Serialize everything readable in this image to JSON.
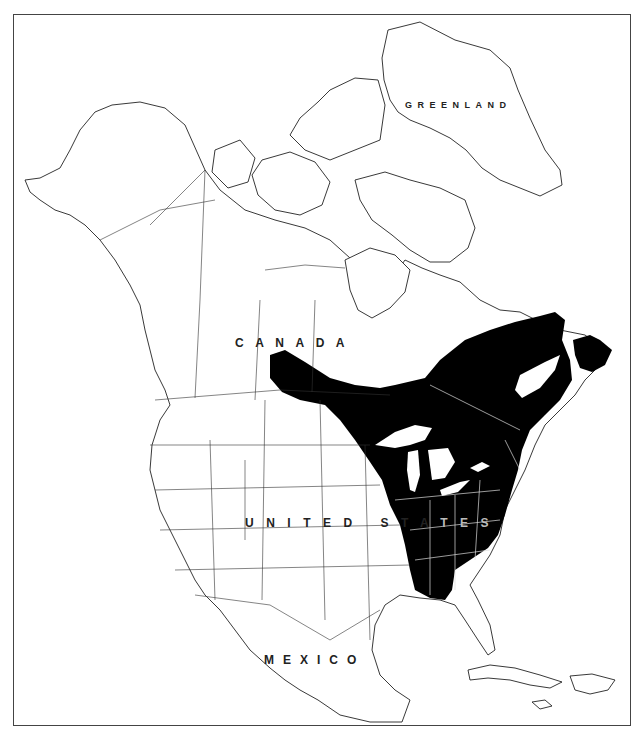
{
  "map": {
    "type": "species-range-map",
    "region": "North America",
    "colors": {
      "background": "#ffffff",
      "range_fill": "#000000",
      "outline": "#222222",
      "frame": "#444444"
    },
    "labels": {
      "greenland": "GREENLAND",
      "canada": "CANADA",
      "united_states_light": "UNITED STA",
      "united_states_dark": "TES",
      "mexico": "MEXICO"
    },
    "range": {
      "description": "Eastern North America: from northern Alberta/Saskatchewan east across southern Canada to Labrador, Newfoundland and the Maritimes, south through the Great Lakes and Appalachian states to the Gulf Coast of Alabama/Mississippi and the Florida panhandle",
      "fill": "solid black"
    }
  }
}
